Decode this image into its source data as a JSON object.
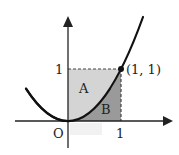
{
  "figure": {
    "type": "function-graph",
    "function": "y = x^2",
    "labels": {
      "origin": "O",
      "x_tick": "1",
      "y_tick": "1",
      "point": "(1, 1)",
      "region_a": "A",
      "region_b": "B"
    },
    "colors": {
      "region_a": "#d4d4d4",
      "region_b": "#9a9a9a",
      "curve": "#111111",
      "axis": "#222222",
      "dash": "#444444"
    }
  }
}
